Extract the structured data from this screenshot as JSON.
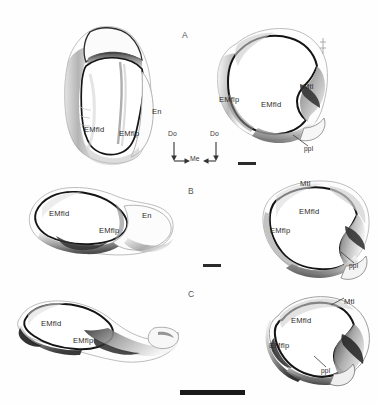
{
  "figure": {
    "caption_title": "Comparative views of distal tarsal/metatarsal elements",
    "background_color": "#ffffff",
    "ink_color": "#1a1a1a",
    "shading_color": "#5a5a5a"
  },
  "panels": [
    {
      "id": "A",
      "letter": "A",
      "row": 1,
      "specimens": [
        {
          "view": "lateral-view",
          "side": "left",
          "labels": [
            {
              "text": "EMfld",
              "x": 88,
              "y": 130
            },
            {
              "text": "EMflp",
              "x": 122,
              "y": 133
            },
            {
              "text": "En",
              "x": 152,
              "y": 113
            }
          ]
        },
        {
          "view": "articular-surface-view",
          "side": "right",
          "labels": [
            {
              "text": "EMflp",
              "x": 220,
              "y": 100
            },
            {
              "text": "EMfld",
              "x": 262,
              "y": 105
            },
            {
              "text": "Mtl",
              "x": 303,
              "y": 88
            },
            {
              "text": "ppl",
              "x": 305,
              "y": 149
            }
          ]
        }
      ],
      "scalebar": {
        "x": 238,
        "y": 163,
        "width": 18,
        "weight": "thin"
      }
    },
    {
      "id": "B",
      "letter": "B",
      "row": 2,
      "specimens": [
        {
          "view": "lateral-view",
          "side": "left",
          "labels": [
            {
              "text": "EMfld",
              "x": 52,
              "y": 215
            },
            {
              "text": "EMflp",
              "x": 100,
              "y": 232
            },
            {
              "text": "En",
              "x": 143,
              "y": 217
            }
          ]
        },
        {
          "view": "articular-surface-view",
          "side": "right",
          "labels": [
            {
              "text": "Mtl",
              "x": 300,
              "y": 185
            },
            {
              "text": "EMfld",
              "x": 300,
              "y": 213
            },
            {
              "text": "EMflp",
              "x": 272,
              "y": 232
            },
            {
              "text": "ppl",
              "x": 350,
              "y": 266
            }
          ]
        }
      ],
      "scalebar": {
        "x": 203,
        "y": 265,
        "width": 18,
        "weight": "thin"
      }
    },
    {
      "id": "C",
      "letter": "C",
      "row": 3,
      "specimens": [
        {
          "view": "lateral-view",
          "side": "left",
          "labels": [
            {
              "text": "EMfld",
              "x": 42,
              "y": 325
            },
            {
              "text": "EMflp",
              "x": 75,
              "y": 341
            }
          ]
        },
        {
          "view": "articular-surface-view",
          "side": "right",
          "labels": [
            {
              "text": "Mtl",
              "x": 345,
              "y": 303
            },
            {
              "text": "EMfld",
              "x": 293,
              "y": 322
            },
            {
              "text": "EMflp",
              "x": 272,
              "y": 347
            },
            {
              "text": "ppl",
              "x": 322,
              "y": 371
            }
          ]
        }
      ],
      "scalebar": {
        "x": 180,
        "y": 390,
        "width": 65,
        "weight": "thick"
      }
    }
  ],
  "orientation_compass": {
    "name": "orientation-indicator",
    "x": 172,
    "y": 134,
    "labels": {
      "left_vertical": "Do",
      "right_vertical": "Do",
      "horizontal": "Me"
    }
  },
  "abbreviations": {
    "EMfld": "EMfld",
    "EMflp": "EMflp",
    "En": "En",
    "Mtl": "Mtl",
    "ppl": "ppl",
    "Do": "Do",
    "Me": "Me"
  }
}
